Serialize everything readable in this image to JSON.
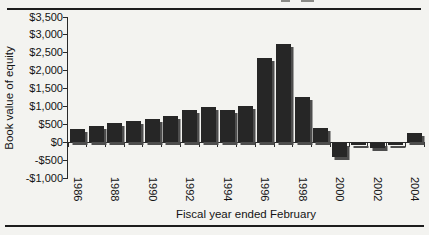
{
  "chart_data": {
    "type": "bar",
    "title": "",
    "ylabel": "Book value of equity",
    "xlabel": "Fiscal year ended February",
    "categories": [
      "1986",
      "1987",
      "1988",
      "1989",
      "1990",
      "1991",
      "1992",
      "1993",
      "1994",
      "1995",
      "1996",
      "1997",
      "1998",
      "1999",
      "2000",
      "2001",
      "2002",
      "2003",
      "2004"
    ],
    "values": [
      380,
      450,
      550,
      600,
      660,
      730,
      900,
      975,
      900,
      1010,
      2350,
      2750,
      1270,
      400,
      -420,
      -80,
      -170,
      -90,
      260
    ],
    "visible_x_tick_labels": [
      "1986",
      "1988",
      "1990",
      "1992",
      "1994",
      "1996",
      "1998",
      "2000",
      "2002",
      "2004"
    ],
    "x_label_rotation_deg": 90,
    "y_ticks": [
      {
        "value": 3500,
        "label": "$3,500"
      },
      {
        "value": 3000,
        "label": "$3,000"
      },
      {
        "value": 2500,
        "label": "$2,500"
      },
      {
        "value": 2000,
        "label": "$2,000"
      },
      {
        "value": 1500,
        "label": "$1,500"
      },
      {
        "value": 1000,
        "label": "$1,000"
      },
      {
        "value": 500,
        "label": "$500"
      },
      {
        "value": 0,
        "label": "$0"
      },
      {
        "value": -500,
        "label": "-$500"
      },
      {
        "value": -1000,
        "label": "-$1,000"
      }
    ],
    "ylim": [
      -1000,
      3500
    ],
    "grid": false,
    "legend": false,
    "bar_color": "#262626",
    "bar_shadow_color": "#4d4d4d",
    "axis_color": "#2a2a2a",
    "background_color": "#f3f3f0"
  }
}
